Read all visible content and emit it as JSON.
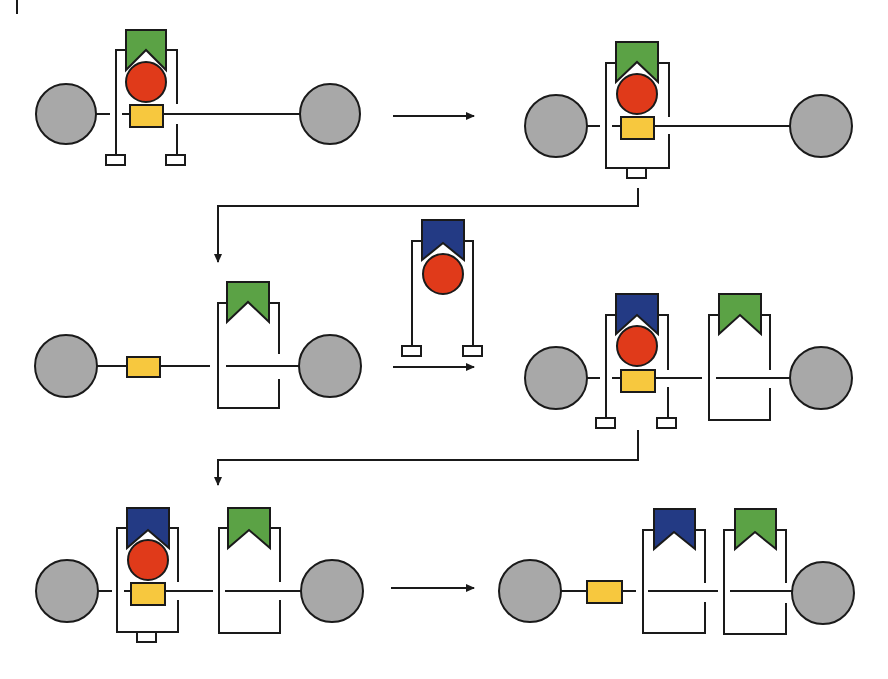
{
  "diagram": {
    "type": "schematic sequence (no text labels)",
    "colors": {
      "gray_node": "#a8a8a8",
      "green_cap": "#5ba245",
      "blue_cap": "#233a84",
      "red_ball": "#e03a1a",
      "yellow_block": "#f7c83e",
      "stroke": "#1a1a1a",
      "background": "#ffffff"
    },
    "panels": [
      {
        "id": "row1-left",
        "description": "open bracket with green cap, red ball, yellow block on axle between two gray nodes, two feet"
      },
      {
        "id": "row1-right",
        "description": "closed bracket with green cap, red ball, yellow block, single bottom foot"
      },
      {
        "id": "row2-left",
        "description": "yellow block on axle, empty closed bracket with green cap, gray nodes"
      },
      {
        "id": "row2-middle",
        "description": "incoming open bracket with blue cap and red ball, two feet"
      },
      {
        "id": "row2-right",
        "description": "blue-capped bracket with red ball and yellow block beside green-capped bracket"
      },
      {
        "id": "row3-left",
        "description": "closed blue-capped bracket with red ball and yellow block beside green-capped bracket"
      },
      {
        "id": "row3-right",
        "description": "yellow block free on axle, empty blue-capped and green-capped brackets"
      }
    ],
    "arrows": [
      {
        "from": "row1-left",
        "to": "row1-right",
        "style": "straight"
      },
      {
        "from": "row1-right",
        "to": "row2-left",
        "style": "elbow"
      },
      {
        "from": "row2-left",
        "to": "row2-right",
        "style": "straight"
      },
      {
        "from": "row2-right",
        "to": "row3-left",
        "style": "elbow"
      },
      {
        "from": "row3-left",
        "to": "row3-right",
        "style": "straight"
      }
    ]
  }
}
